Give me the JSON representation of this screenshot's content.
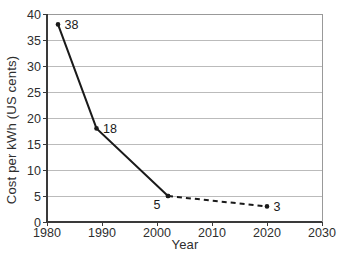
{
  "chart_data": {
    "type": "line",
    "title": "",
    "xlabel": "Year",
    "ylabel": "Cost per kWh (US cents)",
    "xlim": [
      1980,
      2030
    ],
    "ylim": [
      0,
      40
    ],
    "x_ticks": [
      1980,
      1990,
      2000,
      2010,
      2020,
      2030
    ],
    "y_ticks": [
      0,
      5,
      10,
      15,
      20,
      25,
      30,
      35,
      40
    ],
    "grid": "horizontal",
    "legend": "none",
    "series": [
      {
        "name": "historical-cost",
        "style": "solid",
        "color": "#1a1a1a",
        "points": [
          {
            "x": 1982,
            "y": 38,
            "label": "38",
            "label_pos": "right"
          },
          {
            "x": 1989,
            "y": 18,
            "label": "18",
            "label_pos": "right"
          },
          {
            "x": 2002,
            "y": 5,
            "label": "5",
            "label_pos": "below-left"
          }
        ]
      },
      {
        "name": "projected-cost",
        "style": "dashed",
        "color": "#1a1a1a",
        "points": [
          {
            "x": 2002,
            "y": 5,
            "label": "",
            "label_pos": "none"
          },
          {
            "x": 2020,
            "y": 3,
            "label": "3",
            "label_pos": "right"
          }
        ]
      }
    ],
    "colors": {
      "grid": "#bbbbbb",
      "box": "#999999",
      "axis": "#3a3a3a",
      "line": "#1a1a1a",
      "text": "#2e2e2e",
      "background": "#ffffff"
    }
  }
}
